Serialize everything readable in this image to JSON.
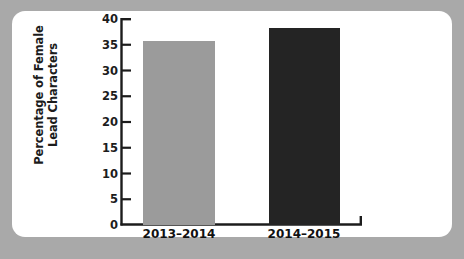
{
  "figure": {
    "background_color": "#a9a9a9",
    "card_color": "#ffffff"
  },
  "chart_data": {
    "type": "bar",
    "title": "",
    "subtitle": "",
    "xlabel": "",
    "ylabel": "Percentage of Female Lead Characters",
    "ylabel_line1": "Percentage of Female",
    "ylabel_line2": "Lead Characters",
    "categories": [
      "2013–2014",
      "2014–2015"
    ],
    "values": [
      35.8,
      38.2
    ],
    "bar_colors": [
      "#9b9b9b",
      "#242424"
    ],
    "ylim": [
      0,
      40
    ],
    "yticks": [
      0,
      5,
      10,
      15,
      20,
      25,
      30,
      35,
      40
    ],
    "ytick_labels": [
      "0",
      "5",
      "10",
      "15",
      "20",
      "25",
      "30",
      "35",
      "40"
    ],
    "grid": false,
    "legend": false,
    "legend_position": "none",
    "axis_color": "#1c1c1c"
  }
}
